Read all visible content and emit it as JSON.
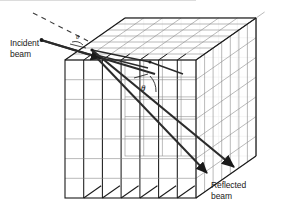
{
  "figure": {
    "type": "crystal-lattice-bragg-diffraction"
  },
  "labels": {
    "incident_beam": "Incident\nbeam",
    "reflected_beam": "Reflected\nbeam",
    "theta_main": "θ",
    "theta_entry": "θ"
  },
  "colors": {
    "background": "#ffffff",
    "grid_line": "#8a8a8a",
    "edge_line": "#1a1a1a",
    "beam_line": "#2b2b2b",
    "dashed_line": "#3a3a3a",
    "text": "#1a1a1a"
  },
  "geometry": {
    "cube_front_left_x": 65,
    "cube_front_right_x": 196,
    "cube_front_top_y": 60,
    "cube_front_bottom_y": 198,
    "depth_dx": 60,
    "depth_dy": -42,
    "front_vertical_divisions": 7,
    "front_horizontal_divisions": 7,
    "depth_divisions": 7
  },
  "beams": {
    "incident": {
      "start_x": 42,
      "start_y": 40,
      "end_x": 150,
      "end_y": 72,
      "arrow": "mid-arrow"
    },
    "dashed_extension": {
      "start_x": 33,
      "start_y": 13,
      "end_x": 92,
      "end_y": 43,
      "dash_pattern": "5 4"
    },
    "reflected_primary": {
      "start_x": 92,
      "start_y": 49,
      "end_x": 232,
      "end_y": 166,
      "arrow": "end-arrow"
    },
    "reflected_secondary": {
      "start_x": 96,
      "start_y": 57,
      "end_x": 206,
      "end_y": 172,
      "arrow": "end-arrow"
    }
  }
}
